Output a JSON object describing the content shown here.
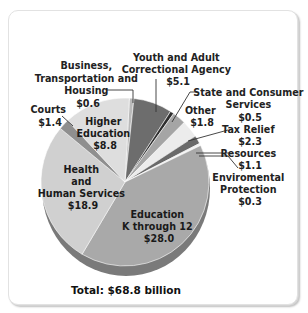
{
  "chart_data": {
    "type": "pie",
    "title": "",
    "units": "billions of dollars",
    "total_label": "Total: $68.8 billion",
    "total": 68.8,
    "slices": [
      {
        "label": "Business, Transportation and Housing",
        "value": 0.6,
        "value_label": "$0.6",
        "color": "#b9b9b9"
      },
      {
        "label": "Youth and Adult Correctional Agency",
        "value": 5.1,
        "value_label": "$5.1",
        "color": "#6d6d6d"
      },
      {
        "label": "State and Consumer Services",
        "value": 0.5,
        "value_label": "$0.5",
        "color": "#2e2e2e"
      },
      {
        "label": "Other",
        "value": 1.8,
        "value_label": "$1.8",
        "color": "#a5a5a5"
      },
      {
        "label": "Tax Relief",
        "value": 2.3,
        "value_label": "$2.3",
        "color": "#ececec"
      },
      {
        "label": "Resources",
        "value": 1.1,
        "value_label": "$1.1",
        "color": "#6a6a6a"
      },
      {
        "label": "Enviromental Protection",
        "value": 0.3,
        "value_label": "$0.3",
        "color": "#f4f4f4"
      },
      {
        "label": "Education K through 12",
        "value": 28.0,
        "value_label": "$28.0",
        "color": "#a9a9a9"
      },
      {
        "label": "Health and Human Services",
        "value": 18.9,
        "value_label": "$18.9",
        "color": "#d0d0d0"
      },
      {
        "label": "Courts",
        "value": 1.4,
        "value_label": "$1.4",
        "color": "#8f8f8f"
      },
      {
        "label": "Higher Education",
        "value": 8.8,
        "value_label": "$8.8",
        "color": "#dedede"
      }
    ],
    "legend": "none (callout labels)"
  },
  "labels": {
    "business": [
      "Business,",
      "Transportation and",
      "Housing",
      "$0.6"
    ],
    "youth": [
      "Youth and Adult",
      "Correctional Agency",
      "$5.1"
    ],
    "state": [
      "State and Consumer",
      "Services",
      "$0.5"
    ],
    "other": [
      "Other",
      "$1.8"
    ],
    "tax": [
      "Tax Relief",
      "$2.3"
    ],
    "resources": [
      "Resources",
      "$1.1"
    ],
    "environmental": [
      "Enviromental",
      "Protection",
      "$0.3"
    ],
    "courts": [
      "Courts",
      "$1.4"
    ],
    "higher_ed": [
      "Higher",
      "Education",
      "$8.8"
    ],
    "health": [
      "Health",
      "and",
      "Human Services",
      "$18.9"
    ],
    "k12": [
      "Education",
      "K through 12",
      "$28.0"
    ]
  },
  "footer": {
    "total": "Total: $68.8 billion"
  }
}
